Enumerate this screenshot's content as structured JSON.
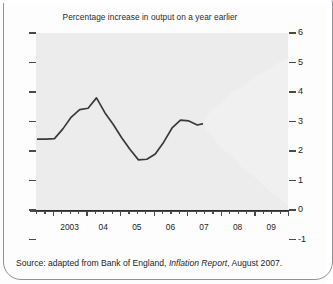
{
  "chart_data": {
    "type": "area",
    "title": "Percentage increase in output on a year earlier",
    "xlabel": "",
    "ylabel": "",
    "ylim": [
      -1,
      6
    ],
    "yticks": [
      -1,
      0,
      1,
      2,
      3,
      4,
      5,
      6
    ],
    "ytick_labels": [
      "-1",
      "0",
      "1",
      "2",
      "3",
      "4",
      "5",
      "6"
    ],
    "xlim": [
      2002.5,
      2010.0
    ],
    "xticks": [
      2003,
      2004,
      2005,
      2006,
      2007,
      2008,
      2009
    ],
    "xtick_labels": [
      "2003",
      "04",
      "05",
      "06",
      "07",
      "08",
      "09"
    ],
    "grid": false,
    "legend": "none",
    "series": [
      {
        "name": "Actual GDP growth",
        "type": "line",
        "color": "#3a3a3a",
        "x": [
          2002.55,
          2002.8,
          2003.05,
          2003.3,
          2003.55,
          2003.8,
          2004.05,
          2004.3,
          2004.55,
          2004.8,
          2005.05,
          2005.3,
          2005.55,
          2005.8,
          2006.05,
          2006.3,
          2006.55,
          2006.8,
          2007.05,
          2007.3,
          2007.45
        ],
        "y": [
          2.4,
          2.4,
          2.42,
          2.75,
          3.15,
          3.4,
          3.45,
          3.8,
          3.3,
          2.9,
          2.45,
          2.05,
          1.7,
          1.72,
          1.9,
          2.3,
          2.78,
          3.05,
          3.02,
          2.88,
          2.92
        ]
      }
    ],
    "fan": {
      "name": "Projection fan (probability density)",
      "start_x": 2007.45,
      "end_x": 2010.0,
      "central_start": 2.92,
      "central_end": 2.45,
      "bands": [
        {
          "percentile": 90,
          "shade": "#f0f0f0"
        },
        {
          "percentile": 80,
          "shade": "#e2e2e2"
        },
        {
          "percentile": 70,
          "shade": "#d2d2d2"
        },
        {
          "percentile": 60,
          "shade": "#c0c0c0"
        },
        {
          "percentile": 50,
          "shade": "#ababab"
        },
        {
          "percentile": 40,
          "shade": "#969696"
        },
        {
          "percentile": 30,
          "shade": "#818181"
        },
        {
          "percentile": 20,
          "shade": "#6d6d6d"
        },
        {
          "percentile": 10,
          "shade": "#5a5a5a"
        }
      ],
      "upper_end": 5.05,
      "lower_end": 0.05
    },
    "zero_line": 0
  },
  "source": {
    "prefix": "Source: adapted from Bank of England, ",
    "italic": "Inflation Report",
    "suffix": ", August 2007."
  }
}
